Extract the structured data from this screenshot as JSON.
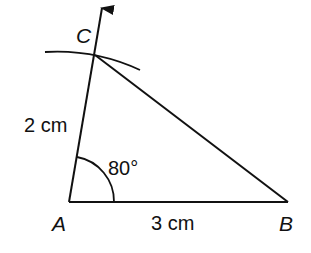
{
  "diagram": {
    "stroke_color": "#111111",
    "background": "#ffffff",
    "points": {
      "A": {
        "label": "A",
        "x": 69,
        "y": 202
      },
      "B": {
        "label": "B",
        "x": 288,
        "y": 202
      },
      "C": {
        "label": "C",
        "x": 95,
        "y": 55
      }
    },
    "measurements": {
      "AB": "3 cm",
      "AC": "2 cm",
      "angle_A": "80°"
    },
    "ray_arrow_tip": {
      "x": 102,
      "y": 5
    },
    "construction_arc": {
      "from": [
        45,
        52
      ],
      "through": [
        95,
        55
      ],
      "to": [
        140,
        70
      ]
    },
    "angle_arc": {
      "center": [
        69,
        202
      ],
      "radius": 45
    }
  }
}
